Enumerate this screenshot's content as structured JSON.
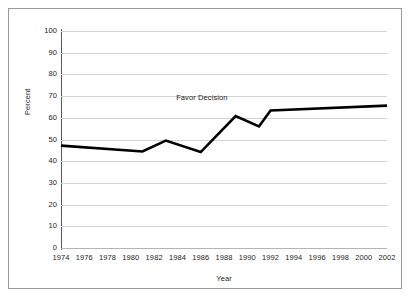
{
  "chart_data": {
    "type": "line",
    "title": "",
    "xlabel": "Year",
    "ylabel": "Percent",
    "xlim": [
      1974,
      2002
    ],
    "ylim": [
      0,
      100
    ],
    "grid": true,
    "legend_position": "inline-annotation",
    "x_tick_labels": [
      "1974",
      "1976",
      "1978",
      "1980",
      "1982",
      "1984",
      "1986",
      "1988",
      "1990",
      "1992",
      "1994",
      "1996",
      "1998",
      "2000",
      "2002"
    ],
    "y_tick_labels": [
      "0",
      "10",
      "20",
      "30",
      "40",
      "50",
      "60",
      "70",
      "80",
      "90",
      "100"
    ],
    "y_ticks": [
      0,
      10,
      20,
      30,
      40,
      50,
      60,
      70,
      80,
      90,
      100
    ],
    "series": [
      {
        "name": "Favor Decision",
        "annotation": "Favor Decision",
        "annotation_x": 1986.1,
        "annotation_y": 69.5,
        "color": "#000000",
        "line_width": 2.6,
        "x": [
          1974,
          1981,
          1983,
          1986,
          1989,
          1991,
          1992,
          2002
        ],
        "values": [
          47.2,
          44.5,
          49.5,
          44.2,
          60.8,
          56.0,
          63.4,
          65.6
        ]
      }
    ]
  },
  "figure": {
    "border_color": "#9a9a9a",
    "background_color": "#ffffff",
    "gridline_color": "#d2d2d2",
    "axis_color": "#5a5a5a"
  }
}
